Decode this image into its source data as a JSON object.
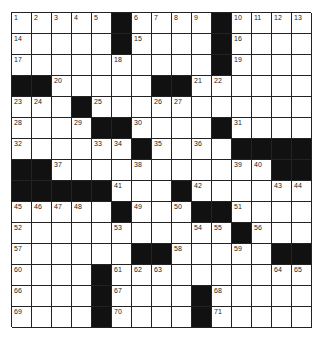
{
  "puzzle": {
    "rows": 15,
    "cols": 15,
    "grid": [
      "1,2,3,4,5,#,6,7,8,9,#,10,11,12,13",
      "14,.,.,.,.,#,15,.,.,.,#,16,.,.,.",
      "17,.,.,.,.,18,.,.,.,.,#,19,.,.,.",
      "#,#,20,.,.,.,.,#,#,21,22,.,.,.,.",
      "23,24,.,#,25,.,.,26,27,.,.,.,.,.,.",
      "28,.,.,29,#,#,30,.,.,.,#,31,.,.,.",
      "32,.,.,.,33,34,#,35,.,36,.,#,#,#,#",
      "#,#,37,.,.,.,38,.,.,.,.,39,40,#,#",
      "#,#,#,#,#,41,.,.,#,42,.,.,.,43,44",
      "45,46,47,48,.,#,49,.,50,#,#,51,.,.,.",
      "52,.,.,.,.,53,.,.,.,54,55,#,56,.,.",
      "57,.,.,.,.,.,#,#,58,.,.,59,.,#,#",
      "60,.,.,.,#,61,62,63,.,.,.,.,.,64,65",
      "66,.,.,.,#,67,.,.,.,#,68,.,.,.,.",
      "69,.,.,.,#,70,.,.,.,#,71,.,.,.,."
    ]
  }
}
